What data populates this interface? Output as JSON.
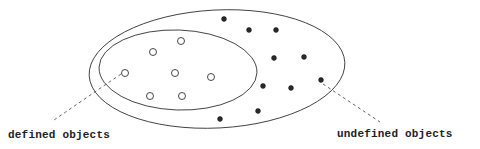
{
  "labels": {
    "defined": "defined objects",
    "undefined": "undefined objects"
  },
  "colors": {
    "stroke": "#333333",
    "dot_fill": "#2a2a2a",
    "background": "#ffffff"
  },
  "outer_ellipse": {
    "cx": 217,
    "cy": 69,
    "rx": 128,
    "ry": 59,
    "rotate": -3
  },
  "inner_ellipse": {
    "cx": 178,
    "cy": 70,
    "rx": 79,
    "ry": 40,
    "rotate": 2
  },
  "defined_objects": [
    {
      "x": 181,
      "y": 41
    },
    {
      "x": 153,
      "y": 52
    },
    {
      "x": 125,
      "y": 73
    },
    {
      "x": 175,
      "y": 73
    },
    {
      "x": 211,
      "y": 77
    },
    {
      "x": 150,
      "y": 96
    },
    {
      "x": 182,
      "y": 96
    }
  ],
  "undefined_objects": [
    {
      "x": 224,
      "y": 19
    },
    {
      "x": 249,
      "y": 30
    },
    {
      "x": 276,
      "y": 30
    },
    {
      "x": 274,
      "y": 58
    },
    {
      "x": 304,
      "y": 57
    },
    {
      "x": 321,
      "y": 80
    },
    {
      "x": 263,
      "y": 86
    },
    {
      "x": 291,
      "y": 88
    },
    {
      "x": 258,
      "y": 111
    },
    {
      "x": 220,
      "y": 119
    }
  ],
  "leaders": [
    {
      "name": "defined-leader",
      "x1": 121,
      "y1": 74,
      "x2": 54,
      "y2": 120
    },
    {
      "name": "undefined-leader",
      "x1": 323,
      "y1": 84,
      "x2": 380,
      "y2": 122
    }
  ]
}
